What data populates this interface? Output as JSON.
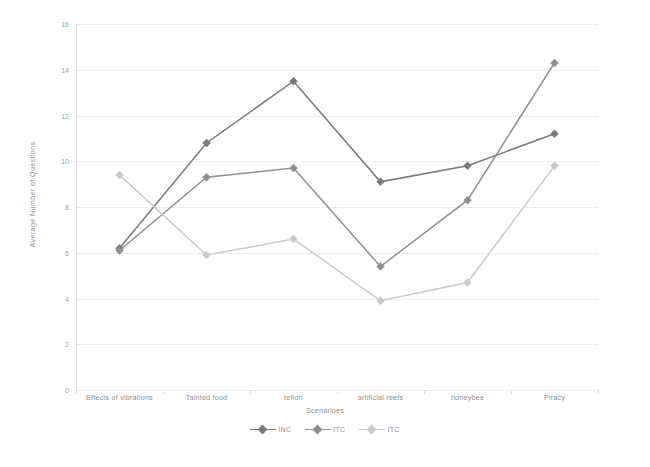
{
  "chart_data": {
    "type": "line",
    "title": "",
    "xlabel": "Scenarioes",
    "ylabel": "Average Number of Questions",
    "categories": [
      "Effects of vibrations",
      "Tainted food",
      "teflon",
      "artificial reefs",
      "honeybee",
      "Piracy"
    ],
    "ylim": [
      0,
      16
    ],
    "yticks": [
      0,
      2,
      4,
      6,
      8,
      10,
      12,
      14,
      16
    ],
    "grid": true,
    "legend_position": "bottom",
    "series": [
      {
        "name": "INC",
        "values": [
          6.2,
          10.8,
          13.5,
          9.1,
          9.8,
          11.2
        ],
        "color": "#7a7a7a",
        "marker": "diamond"
      },
      {
        "name": "ITC",
        "values": [
          6.1,
          9.3,
          9.7,
          5.4,
          8.3,
          14.3
        ],
        "color": "#8f8f8f",
        "marker": "diamond"
      },
      {
        "name": "ITC",
        "values": [
          9.4,
          5.9,
          6.6,
          3.9,
          4.7,
          9.8
        ],
        "color": "#c9c9c9",
        "marker": "diamond"
      }
    ]
  },
  "axis": {
    "y_title": "Average Number of Questions",
    "x_title": "Scenarioes",
    "y_tick_labels": [
      "0",
      "2",
      "4",
      "6",
      "8",
      "10",
      "12",
      "14",
      "16"
    ]
  },
  "legend": {
    "items": [
      {
        "label": "INC"
      },
      {
        "label": "ITC"
      },
      {
        "label": "ITC"
      }
    ]
  },
  "colors": {
    "series1": "#7a7a7a",
    "series2": "#8f8f8f",
    "series3": "#c9c9c9",
    "grid": "#dcdcdc",
    "text": "#8f8f8f",
    "background": "#ffffff"
  }
}
